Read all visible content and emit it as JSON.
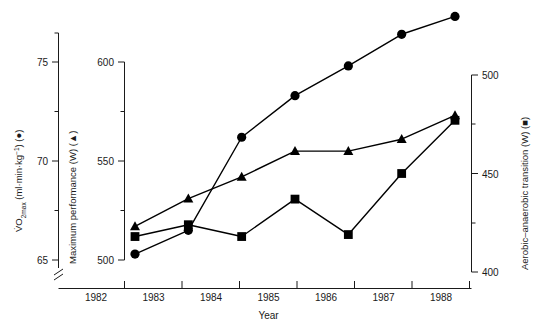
{
  "chart_data": {
    "type": "line",
    "title": "",
    "xlabel": "Year",
    "x": [
      1982.5,
      1983.5,
      1984.5,
      1985.5,
      1986.5,
      1987.5,
      1988.5
    ],
    "categories": [
      "1982",
      "1983",
      "1984",
      "1985",
      "1986",
      "1987",
      "1988"
    ],
    "grid": false,
    "legend_position": "in-axis-labels",
    "series": [
      {
        "name": "VO2 max",
        "marker": "circle",
        "symbol": "●",
        "axis": "left",
        "units": "ml·min·kg⁻¹",
        "values": [
          65.3,
          66.5,
          71.2,
          73.3,
          74.8,
          76.4,
          77.3
        ]
      },
      {
        "name": "Maximum performance",
        "marker": "triangle",
        "symbol": "▲",
        "axis": "middle",
        "units": "W",
        "values": [
          517,
          531,
          542,
          555,
          555,
          561,
          573
        ]
      },
      {
        "name": "Aerobic–anaerobic transition",
        "marker": "square",
        "symbol": "■",
        "axis": "right",
        "units": "W",
        "values": [
          418,
          424,
          418,
          437,
          419,
          450,
          477
        ]
      }
    ],
    "axes": [
      {
        "id": "left",
        "label": "V̇O2 max (ml·min·kg⁻¹) (●)",
        "label_main": "V̇O",
        "label_sub": "2",
        "label_sub2": "max",
        "label_rest": " (ml·min·kg",
        "label_sup": "−1",
        "label_tail": ") (●)",
        "ticks": [
          65,
          70,
          75
        ],
        "tick_labels": [
          "65",
          "70",
          "75"
        ],
        "minor_ticks": [
          67.5,
          72.5,
          77.5
        ],
        "range": [
          65,
          78.5
        ],
        "broken": true
      },
      {
        "id": "middle",
        "label": "Maximum performance (W) (▲)",
        "ticks": [
          500,
          550,
          600
        ],
        "tick_labels": [
          "500",
          "550",
          "600"
        ],
        "minor_ticks": [
          525,
          575
        ],
        "range": [
          500,
          600
        ]
      },
      {
        "id": "right",
        "label": "Aerobic–anaerobic transition (W) (■)",
        "ticks": [
          400,
          450,
          500
        ],
        "tick_labels": [
          "400",
          "450",
          "500"
        ],
        "minor_ticks": [
          425,
          475
        ],
        "range": [
          400,
          500
        ]
      }
    ]
  },
  "colors": {
    "axis": "#1a1a1a",
    "line": "#000000",
    "marker": "#000000",
    "background": "#ffffff"
  }
}
